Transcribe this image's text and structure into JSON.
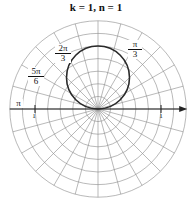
{
  "title": "k = 1, n = 1",
  "chart_data": {
    "type": "polar-line",
    "title": "k = 1, n = 1",
    "equation_family": "r = sin(kθ)^n style rose/circle",
    "center_px": [
      98,
      109
    ],
    "unit_px": 63,
    "grid": {
      "ring_step": 0.2,
      "ring_count": 7,
      "r_max": 1.4,
      "spoke_step_deg": 15
    },
    "curve": {
      "description": "circle of diameter 1 tangent to polar axis at origin, above axis",
      "center": [
        0,
        0.5
      ],
      "radius": 0.5
    },
    "axis": {
      "arrow_direction": "right",
      "tick_labels_at_r": [
        1,
        -1
      ]
    },
    "angle_labels": [
      {
        "text": "π/3",
        "num": "π",
        "den": "3",
        "angle_deg": 60
      },
      {
        "text": "2π/3",
        "num": "2π",
        "den": "3",
        "angle_deg": 120
      },
      {
        "text": "5π/6",
        "num": "5π",
        "den": "6",
        "angle_deg": 150
      },
      {
        "text": "π",
        "angle_deg": 180
      }
    ],
    "tick_labels": [
      "1",
      "1"
    ]
  },
  "colors": {
    "grid": "#8a8a8a",
    "curve": "#2a2a2a",
    "axis": "#222222"
  }
}
